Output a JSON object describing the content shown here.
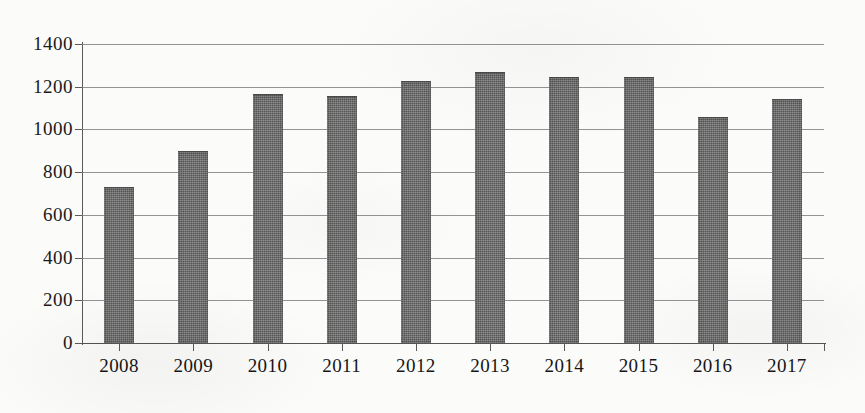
{
  "chart_data": {
    "type": "bar",
    "title": "",
    "subtitle": "",
    "xlabel": "",
    "ylabel": "",
    "categories": [
      "2008",
      "2009",
      "2010",
      "2011",
      "2012",
      "2013",
      "2014",
      "2015",
      "2016",
      "2017"
    ],
    "values": [
      725,
      895,
      1160,
      1150,
      1220,
      1265,
      1240,
      1240,
      1055,
      1140
    ],
    "ylim": [
      0,
      1400
    ],
    "y_ticks": [
      0,
      200,
      400,
      600,
      800,
      1000,
      1200,
      1400
    ],
    "y_tick_labels": [
      "0",
      "200",
      "400",
      "600",
      "800",
      "1000",
      "1200",
      "1400"
    ],
    "grid": true,
    "grid_axis": "y",
    "legend": false,
    "legend_position": "none",
    "annotations": [],
    "bar_color": "#6e6e6e",
    "gridline_color": "#808080",
    "axis_color": "#5a5a5a",
    "background_color": "#fbfbfa",
    "text_color": "#1a1a1a"
  }
}
